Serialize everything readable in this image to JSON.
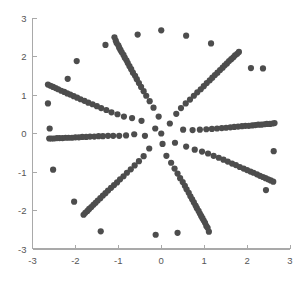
{
  "chart_data": {
    "type": "scatter",
    "title": "",
    "subtitle": "",
    "xlabel": "",
    "ylabel": "",
    "xlim": [
      -3,
      3
    ],
    "ylim": [
      -3,
      3
    ],
    "grid": false,
    "legend": null,
    "marker": {
      "shape": "circle",
      "color": "#4d4d4d",
      "size_px": 3.1
    },
    "axis_color": "#a9a9a9",
    "tick_label_color": "#555555",
    "background_color": "#ffffff",
    "xticks": [
      -3,
      -2,
      -1,
      0,
      1,
      2,
      3
    ],
    "xtick_labels": [
      "-3",
      "-2",
      "-1",
      "0",
      "1",
      "2",
      "3"
    ],
    "yticks": [
      -3,
      -2,
      -1,
      0,
      1,
      2,
      3
    ],
    "ytick_labels": [
      "-3",
      "-2",
      "-1",
      "0",
      "1",
      "2",
      "3"
    ],
    "n_points": 201,
    "generator": {
      "kind": "phyllotaxis",
      "golden_angle_deg": 137.508,
      "radius_max": 2.7,
      "count": 201
    },
    "points": [
      [
        0.0,
        0.0
      ],
      [
        -0.14,
        0.13
      ],
      [
        0.03,
        -0.27
      ],
      [
        0.2,
        0.26
      ],
      [
        -0.38,
        -0.06
      ],
      [
        0.32,
        -0.24
      ],
      [
        -0.06,
        0.44
      ],
      [
        -0.28,
        -0.39
      ],
      [
        0.51,
        0.1
      ],
      [
        -0.46,
        0.33
      ],
      [
        0.12,
        -0.58
      ],
      [
        0.35,
        0.51
      ],
      [
        -0.63,
        -0.02
      ],
      [
        0.58,
        -0.34
      ],
      [
        -0.18,
        0.67
      ],
      [
        -0.41,
        -0.59
      ],
      [
        0.73,
        0.09
      ],
      [
        -0.68,
        0.4
      ],
      [
        0.23,
        -0.76
      ],
      [
        0.46,
        0.66
      ],
      [
        -0.82,
        -0.05
      ],
      [
        0.78,
        -0.42
      ],
      [
        -0.27,
        0.84
      ],
      [
        -0.52,
        -0.72
      ],
      [
        0.9,
        0.1
      ],
      [
        -0.87,
        0.44
      ],
      [
        0.31,
        -0.91
      ],
      [
        0.57,
        0.78
      ],
      [
        -0.98,
        -0.06
      ],
      [
        0.95,
        -0.47
      ],
      [
        -0.35,
        0.98
      ],
      [
        -0.62,
        -0.83
      ],
      [
        1.05,
        0.11
      ],
      [
        -1.02,
        0.5
      ],
      [
        0.38,
        -1.04
      ],
      [
        0.67,
        0.88
      ],
      [
        -1.12,
        -0.06
      ],
      [
        1.09,
        -0.52
      ],
      [
        -0.41,
        1.1
      ],
      [
        -0.71,
        -0.93
      ],
      [
        1.18,
        0.12
      ],
      [
        -1.16,
        0.55
      ],
      [
        0.44,
        -1.16
      ],
      [
        0.76,
        0.98
      ],
      [
        -1.24,
        -0.06
      ],
      [
        1.22,
        -0.58
      ],
      [
        -0.47,
        1.21
      ],
      [
        -0.8,
        -1.02
      ],
      [
        1.3,
        0.13
      ],
      [
        -1.28,
        0.61
      ],
      [
        0.5,
        -1.26
      ],
      [
        0.84,
        1.07
      ],
      [
        -1.36,
        -0.07
      ],
      [
        1.34,
        -0.63
      ],
      [
        -0.52,
        1.31
      ],
      [
        -0.88,
        -1.11
      ],
      [
        1.41,
        0.14
      ],
      [
        -1.4,
        0.66
      ],
      [
        0.55,
        -1.36
      ],
      [
        0.92,
        1.15
      ],
      [
        -1.46,
        -0.07
      ],
      [
        1.45,
        -0.68
      ],
      [
        -0.57,
        1.41
      ],
      [
        -0.96,
        -1.19
      ],
      [
        1.51,
        0.15
      ],
      [
        -1.5,
        0.71
      ],
      [
        0.59,
        -1.45
      ],
      [
        0.99,
        1.23
      ],
      [
        -1.56,
        -0.08
      ],
      [
        1.55,
        -0.73
      ],
      [
        -0.61,
        1.5
      ],
      [
        -1.03,
        -1.27
      ],
      [
        1.61,
        0.16
      ],
      [
        -1.6,
        0.76
      ],
      [
        0.64,
        -1.54
      ],
      [
        1.06,
        1.31
      ],
      [
        -1.66,
        -0.08
      ],
      [
        1.65,
        -0.78
      ],
      [
        -0.66,
        1.58
      ],
      [
        -1.1,
        -1.34
      ],
      [
        1.7,
        0.17
      ],
      [
        -1.7,
        0.8
      ],
      [
        0.68,
        -1.63
      ],
      [
        1.13,
        1.38
      ],
      [
        -1.75,
        -0.09
      ],
      [
        1.74,
        -0.82
      ],
      [
        -0.7,
        1.67
      ],
      [
        -1.17,
        -1.41
      ],
      [
        1.79,
        0.18
      ],
      [
        -1.79,
        0.85
      ],
      [
        0.72,
        -1.71
      ],
      [
        1.19,
        1.45
      ],
      [
        -1.84,
        -0.09
      ],
      [
        1.83,
        -0.87
      ],
      [
        -0.74,
        1.75
      ],
      [
        -1.24,
        -1.48
      ],
      [
        1.88,
        0.19
      ],
      [
        -1.88,
        0.89
      ],
      [
        0.76,
        -1.79
      ],
      [
        1.25,
        1.52
      ],
      [
        -1.92,
        -0.1
      ],
      [
        1.92,
        -0.91
      ],
      [
        -0.78,
        1.83
      ],
      [
        -1.3,
        -1.55
      ],
      [
        1.96,
        0.2
      ],
      [
        -1.96,
        0.93
      ],
      [
        0.8,
        -1.87
      ],
      [
        1.31,
        1.58
      ],
      [
        -2.0,
        -0.1
      ],
      [
        2.0,
        -0.95
      ],
      [
        -0.81,
        1.9
      ],
      [
        -1.36,
        -1.61
      ],
      [
        2.04,
        0.2
      ],
      [
        -2.04,
        0.97
      ],
      [
        0.83,
        -1.94
      ],
      [
        1.37,
        1.65
      ],
      [
        -2.08,
        -0.11
      ],
      [
        2.08,
        -0.99
      ],
      [
        -0.85,
        1.97
      ],
      [
        -1.42,
        -1.68
      ],
      [
        2.12,
        0.21
      ],
      [
        -2.12,
        1.01
      ],
      [
        0.87,
        -2.01
      ],
      [
        1.43,
        1.71
      ],
      [
        -2.16,
        -0.11
      ],
      [
        2.15,
        -1.02
      ],
      [
        -0.88,
        2.04
      ],
      [
        -1.48,
        -1.74
      ],
      [
        2.19,
        0.22
      ],
      [
        -2.19,
        1.04
      ],
      [
        0.9,
        -2.08
      ],
      [
        1.48,
        1.77
      ],
      [
        -2.23,
        -0.11
      ],
      [
        2.23,
        -1.06
      ],
      [
        -0.92,
        2.11
      ],
      [
        -1.53,
        -1.8
      ],
      [
        2.26,
        0.23
      ],
      [
        -2.26,
        1.08
      ],
      [
        0.93,
        -2.14
      ],
      [
        1.53,
        1.82
      ],
      [
        -2.3,
        -0.12
      ],
      [
        2.3,
        -1.1
      ],
      [
        -0.95,
        2.17
      ],
      [
        -1.58,
        -1.85
      ],
      [
        2.33,
        0.23
      ],
      [
        -2.33,
        1.11
      ],
      [
        0.96,
        -2.2
      ],
      [
        1.58,
        1.88
      ],
      [
        -2.37,
        -0.12
      ],
      [
        2.37,
        -1.13
      ],
      [
        -0.98,
        2.23
      ],
      [
        -1.63,
        -1.91
      ],
      [
        2.4,
        0.24
      ],
      [
        -2.4,
        1.15
      ],
      [
        0.99,
        -2.26
      ],
      [
        1.63,
        1.93
      ],
      [
        -2.43,
        -0.12
      ],
      [
        2.43,
        -1.16
      ],
      [
        -1.0,
        2.29
      ],
      [
        -1.68,
        -1.96
      ],
      [
        2.46,
        0.25
      ],
      [
        -2.46,
        1.18
      ],
      [
        1.02,
        -2.32
      ],
      [
        1.68,
        1.98
      ],
      [
        -2.5,
        -0.13
      ],
      [
        2.49,
        -1.19
      ],
      [
        -1.04,
        2.35
      ],
      [
        -1.72,
        -2.01
      ],
      [
        2.53,
        0.25
      ],
      [
        -2.52,
        1.21
      ],
      [
        1.05,
        -2.4
      ],
      [
        1.72,
        2.03
      ],
      [
        -2.56,
        -0.13
      ],
      [
        2.55,
        -1.22
      ],
      [
        -1.06,
        2.41
      ],
      [
        -1.77,
        -2.06
      ],
      [
        2.59,
        0.26
      ],
      [
        -2.58,
        1.24
      ],
      [
        1.08,
        -2.45
      ],
      [
        1.77,
        2.07
      ],
      [
        -2.61,
        -0.13
      ],
      [
        2.61,
        -1.25
      ],
      [
        -1.09,
        2.5
      ],
      [
        -1.81,
        -2.11
      ],
      [
        2.64,
        0.27
      ],
      [
        -2.64,
        1.27
      ],
      [
        1.11,
        -2.55
      ],
      [
        1.81,
        2.12
      ],
      [
        -2.64,
        0.78
      ],
      [
        2.44,
        -1.47
      ],
      [
        -0.55,
        2.57
      ],
      [
        -1.41,
        -2.54
      ],
      [
        2.37,
        1.69
      ],
      [
        -2.18,
        1.42
      ],
      [
        0.38,
        -2.58
      ],
      [
        0.58,
        2.54
      ],
      [
        -2.03,
        -1.77
      ],
      [
        2.62,
        -0.46
      ],
      [
        -1.3,
        2.3
      ],
      [
        -2.52,
        -0.94
      ],
      [
        1.16,
        2.34
      ],
      [
        -1.97,
        1.88
      ],
      [
        0.0,
        2.68
      ],
      [
        -0.13,
        -2.63
      ],
      [
        2.09,
        1.7
      ],
      [
        -2.6,
        0.13
      ]
    ]
  }
}
